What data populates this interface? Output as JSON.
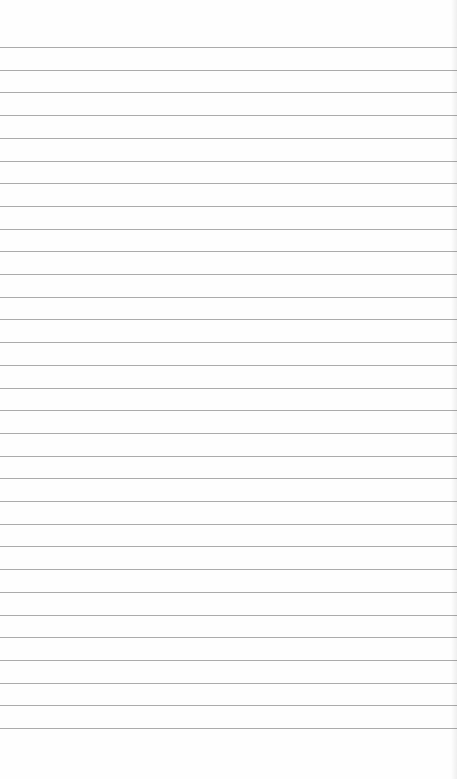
{
  "page": {
    "type": "lined-paper",
    "background_color": "#fefefe",
    "line_color": "#9c9c9c",
    "line_count": 31,
    "first_line_y": 47,
    "line_spacing": 22.7,
    "text_content": ""
  }
}
